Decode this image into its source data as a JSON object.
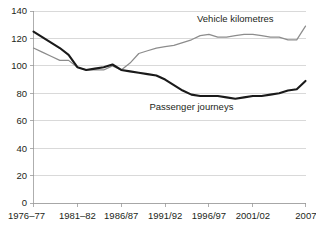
{
  "chart_data": {
    "type": "line",
    "title": "",
    "subtitle": "",
    "xlabel": "",
    "ylabel": "",
    "ylim": [
      0,
      140
    ],
    "ytick_values": [
      0,
      20,
      40,
      60,
      80,
      100,
      120,
      140
    ],
    "ytick_labels": [
      "0",
      "20",
      "40",
      "60",
      "80",
      "100",
      "120",
      "140"
    ],
    "grid": true,
    "legend_position": "inline-annotations",
    "x": [
      "1976–77",
      "1977–78",
      "1978–79",
      "1979–80",
      "1980–81",
      "1981–82",
      "1982–83",
      "1983–84",
      "1984–85",
      "1985/86",
      "1986/87",
      "1987/88",
      "1988/89",
      "1989/90",
      "1990/91",
      "1991/92",
      "1992/93",
      "1993/94",
      "1994/95",
      "1995/96",
      "1996/97",
      "1997/98",
      "1998/99",
      "1999/00",
      "2000/01",
      "2001/02",
      "2002/03",
      "2003/04",
      "2004/05",
      "2005/06",
      "2006/07",
      "2007/08"
    ],
    "xtick_labels": [
      "1976–77",
      "1981–82",
      "1986/87",
      "1991/92",
      "1996/97",
      "2001/02",
      "2007/08"
    ],
    "xtick_indices": [
      0,
      5,
      10,
      15,
      20,
      25,
      31
    ],
    "series": [
      {
        "name": "Vehicle kilometres",
        "color": "#8c8c8c",
        "values": [
          113,
          110,
          107,
          104,
          104,
          99,
          97,
          97,
          97,
          100,
          97,
          102,
          109,
          111,
          113,
          114,
          115,
          117,
          119,
          122,
          123,
          121,
          121,
          122,
          123,
          123,
          122,
          121,
          121,
          119,
          119,
          129
        ],
        "label_x_index": 23,
        "label_y_value": 132
      },
      {
        "name": "Passenger journeys",
        "color": "#1a1a1a",
        "values": [
          125,
          121,
          117,
          113,
          108,
          99,
          97,
          98,
          99,
          101,
          97,
          96,
          95,
          94,
          93,
          90,
          86,
          82,
          79,
          78,
          78,
          78,
          77,
          76,
          77,
          78,
          78,
          79,
          80,
          82,
          83,
          89
        ],
        "label_x_index": 18,
        "label_y_value": 68
      }
    ]
  },
  "colors": {
    "background": "#ffffff",
    "gridline": "#c9c9c9",
    "axis": "#9a9a9a",
    "text": "#231f20",
    "vehicle_series": "#8c8c8c",
    "passenger_series": "#1a1a1a"
  }
}
